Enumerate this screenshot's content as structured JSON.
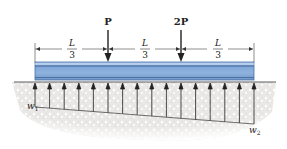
{
  "diagram": {
    "type": "beam-on-elastic-foundation",
    "loads": [
      {
        "label": "P",
        "position_fraction": "1/3"
      },
      {
        "label": "2P",
        "position_fraction": "2/3"
      }
    ],
    "dimensions": [
      {
        "numerator": "L",
        "denominator": "3"
      },
      {
        "numerator": "L",
        "denominator": "3"
      },
      {
        "numerator": "L",
        "denominator": "3"
      }
    ],
    "distributed_load": {
      "left_label": "w",
      "left_subscript": "1",
      "right_label": "w",
      "right_subscript": "2",
      "arrow_count": 16,
      "direction": "upward"
    },
    "colors": {
      "beam_fill": "#8fb3de",
      "beam_dark": "#4a72a8",
      "beam_highlight": "#b9d0ec",
      "soil": "#ecebea",
      "soil_speckle": "#ffffff",
      "ink": "#222222"
    }
  }
}
